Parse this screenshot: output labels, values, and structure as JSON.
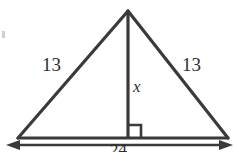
{
  "figure": {
    "background_color": "#ffffff",
    "stroke_color": "#3a3a3a",
    "text_color": "#2e2e2e"
  },
  "labels": {
    "left_side": "13",
    "right_side": "13",
    "altitude": "x",
    "base": "24"
  },
  "geometry": {
    "apex": {
      "x": 128,
      "y": 11
    },
    "bottom_left": {
      "x": 18,
      "y": 138
    },
    "bottom_right": {
      "x": 228,
      "y": 138
    },
    "foot_of_altitude": {
      "x": 128,
      "y": 138
    },
    "right_angle_marker": {
      "size": 13,
      "opens_toward": "right"
    },
    "dimension_line": {
      "y": 145,
      "from_x": 8,
      "to_x": 231,
      "arrowheads": "both"
    }
  },
  "icons": {
    "right_angle": "right-angle-icon",
    "left_arrowhead": "arrow-left-icon",
    "right_arrowhead": "arrow-right-icon"
  }
}
